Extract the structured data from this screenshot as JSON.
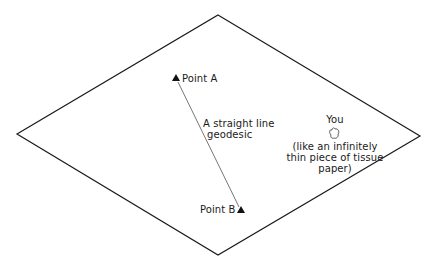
{
  "diagram": {
    "plane": {
      "vertices": {
        "top": [
          218,
          15
        ],
        "right": [
          420,
          136
        ],
        "bottom": [
          218,
          255
        ],
        "left": [
          17,
          134
        ]
      },
      "stroke": "#1a1a1a"
    },
    "point_a": {
      "label": "Point A",
      "position": [
        176,
        78
      ]
    },
    "point_b": {
      "label": "Point B",
      "position": [
        241,
        210
      ]
    },
    "geodesic": {
      "label_line1": "A straight line",
      "label_line2": "geodesic",
      "from": [
        178,
        82
      ],
      "to": [
        239,
        207
      ],
      "stroke": "#555555"
    },
    "you": {
      "label": "You",
      "note_line1": "(like an infinitely",
      "note_line2": "thin piece of tissue",
      "note_line3": "paper)"
    }
  }
}
